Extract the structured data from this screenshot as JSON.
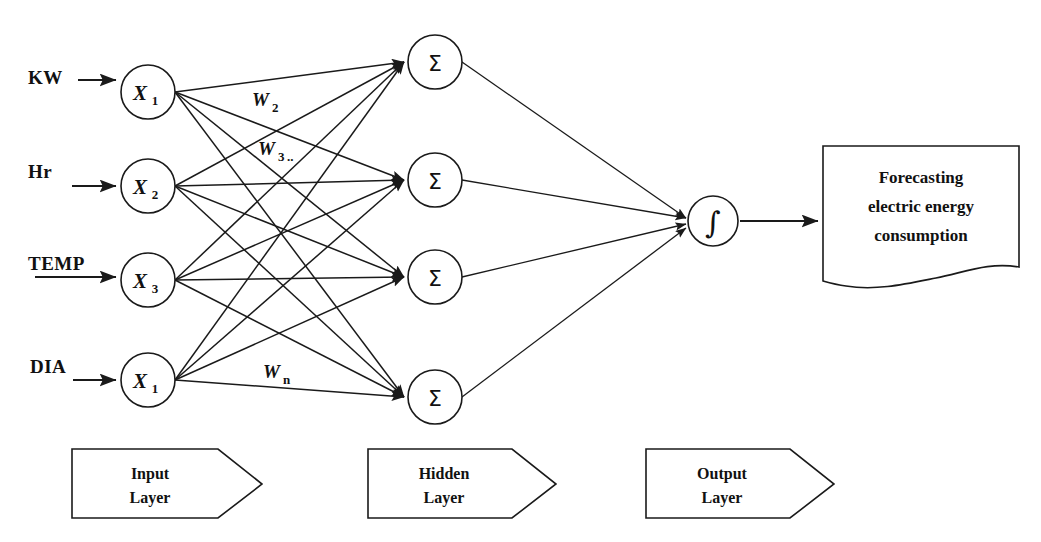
{
  "diagram": {
    "colors": {
      "stroke": "#1a1a1a",
      "fill": "#ffffff",
      "text": "#111111"
    },
    "input_layer": {
      "banner": {
        "line1": "Input",
        "line2": "Layer"
      },
      "nodes": [
        {
          "id": "x1",
          "symbol": "X",
          "subscript": "1",
          "input_label": "KW",
          "cx": 148,
          "cy": 92,
          "r": 27
        },
        {
          "id": "x2",
          "symbol": "X",
          "subscript": "2",
          "input_label": "Hr",
          "cx": 148,
          "cy": 186,
          "r": 27
        },
        {
          "id": "x3",
          "symbol": "X",
          "subscript": "3",
          "input_label": "TEMP",
          "cx": 148,
          "cy": 280,
          "r": 27
        },
        {
          "id": "x4",
          "symbol": "X",
          "subscript": "1",
          "input_label": "DIA",
          "cx": 148,
          "cy": 380,
          "r": 27
        }
      ]
    },
    "hidden_layer": {
      "banner": {
        "line1": "Hidden",
        "line2": "Layer"
      },
      "nodes": [
        {
          "id": "h1",
          "symbol": "Σ",
          "cx": 435,
          "cy": 62,
          "r": 27
        },
        {
          "id": "h2",
          "symbol": "Σ",
          "cx": 435,
          "cy": 180,
          "r": 27
        },
        {
          "id": "h3",
          "symbol": "Σ",
          "cx": 435,
          "cy": 277,
          "r": 27
        },
        {
          "id": "h4",
          "symbol": "Σ",
          "cx": 435,
          "cy": 397,
          "r": 27
        }
      ]
    },
    "output_layer": {
      "banner": {
        "line1": "Output",
        "line2": "Layer"
      },
      "nodes": [
        {
          "id": "o1",
          "symbol": "∫",
          "cx": 713,
          "cy": 221,
          "r": 25
        }
      ]
    },
    "weights": [
      {
        "id": "w2",
        "symbol": "W",
        "subscript": "2",
        "trailing": "",
        "x": 252,
        "y": 106
      },
      {
        "id": "w3",
        "symbol": "W",
        "subscript": "3",
        "trailing": "..",
        "x": 258,
        "y": 155
      },
      {
        "id": "wn",
        "symbol": "W",
        "subscript": "n",
        "trailing": "",
        "x": 263,
        "y": 378
      }
    ],
    "result_document": {
      "lines": [
        "Forecasting",
        "electric energy",
        "consumption"
      ],
      "x": 823,
      "y": 146,
      "width": 196,
      "height": 140
    },
    "connections": {
      "input_to_hidden": "fully-connected",
      "hidden_to_output": "fully-connected",
      "output_to_document": "single-arrow"
    }
  }
}
